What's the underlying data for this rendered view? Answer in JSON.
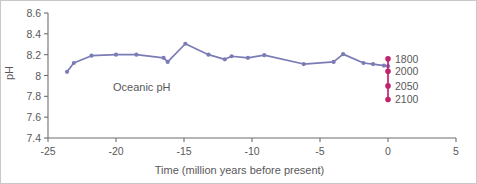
{
  "chart_data": {
    "type": "line",
    "title": "",
    "xlabel": "Time (million years before present)",
    "ylabel": "pH",
    "xlim": [
      -25,
      5
    ],
    "ylim": [
      7.4,
      8.6
    ],
    "xticks": [
      -25,
      -20,
      -15,
      -10,
      -5,
      0,
      5
    ],
    "xtick_labels": [
      "-25",
      "-20",
      "-15",
      "-10",
      "-5",
      "0",
      "5"
    ],
    "yticks": [
      7.4,
      7.6,
      7.8,
      8.0,
      8.2,
      8.4,
      8.6
    ],
    "ytick_labels": [
      "7.4",
      "7.6",
      "7.8",
      "8",
      "8.2",
      "8.4",
      "8.6"
    ],
    "grid": false,
    "legend_position": "none",
    "series": [
      {
        "name": "Oceanic pH",
        "annotation": "Oceanic pH",
        "color": "#7b7cb5",
        "marker": "circle",
        "x": [
          -23.6,
          -23.1,
          -21.8,
          -20.0,
          -18.5,
          -16.5,
          -16.2,
          -14.9,
          -13.2,
          -12.0,
          -11.5,
          -10.3,
          -9.1,
          -6.2,
          -4.0,
          -3.3,
          -1.8,
          -1.1,
          -0.3,
          0.0
        ],
        "y": [
          8.035,
          8.12,
          8.19,
          8.2,
          8.2,
          8.17,
          8.13,
          8.305,
          8.2,
          8.155,
          8.185,
          8.17,
          8.195,
          8.11,
          8.13,
          8.205,
          8.12,
          8.11,
          8.095,
          8.09
        ]
      }
    ],
    "projection_markers": {
      "color": "#c1246c",
      "x": 0.0,
      "points": [
        {
          "label": "1800",
          "value": 8.16
        },
        {
          "label": "2000",
          "value": 8.04
        },
        {
          "label": "2050",
          "value": 7.9
        },
        {
          "label": "2100",
          "value": 7.77
        }
      ]
    }
  }
}
